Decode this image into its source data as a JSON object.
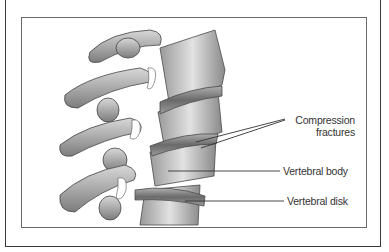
{
  "figure": {
    "labels": [
      {
        "id": "compression",
        "line1": "Compression",
        "line2": "fractures"
      },
      {
        "id": "body",
        "text": "Vertebral body"
      },
      {
        "id": "disk",
        "text": "Vertebral disk"
      }
    ]
  }
}
